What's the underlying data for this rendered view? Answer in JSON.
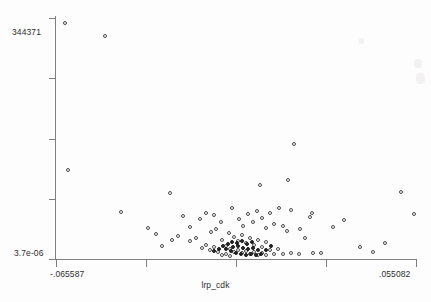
{
  "figure": {
    "background_color": "#fdfdfd",
    "axis_color": "#808080",
    "marker_color": "#4a4a4a"
  },
  "axes": {
    "y_label_top": "344371",
    "y_label_bottom": "3.7e-06",
    "x_label_left": "-.065587",
    "x_label_right": ".055082",
    "x_title": "lrp_cdk",
    "y_title": ""
  },
  "chart_data": {
    "type": "scatter",
    "title": "",
    "xlabel": "lrp_cdk",
    "ylabel": "",
    "grid": false,
    "legend": null,
    "xlim": [
      -0.065587,
      0.055082
    ],
    "ylim": [
      3.7e-06,
      344371
    ],
    "x_tick_labels": [
      "-.065587",
      "",
      "",
      "",
      ".055082"
    ],
    "y_tick_labels": [
      "344371",
      "",
      "",
      "",
      "3.7e-06"
    ],
    "n_ticks_x": 5,
    "n_ticks_y": 5,
    "marker": "open-circle",
    "points": [
      {
        "px": 65,
        "py": 23
      },
      {
        "px": 105,
        "py": 36
      },
      {
        "px": 68,
        "py": 170
      },
      {
        "px": 294,
        "py": 144
      },
      {
        "px": 170,
        "py": 193
      },
      {
        "px": 260,
        "py": 185
      },
      {
        "px": 288,
        "py": 180
      },
      {
        "px": 401,
        "py": 192
      },
      {
        "px": 121,
        "py": 212
      },
      {
        "px": 148,
        "py": 228
      },
      {
        "px": 183,
        "py": 216
      },
      {
        "px": 214,
        "py": 215
      },
      {
        "px": 196,
        "py": 238
      },
      {
        "px": 190,
        "py": 241
      },
      {
        "px": 232,
        "py": 208
      },
      {
        "px": 239,
        "py": 219
      },
      {
        "px": 243,
        "py": 226
      },
      {
        "px": 248,
        "py": 214
      },
      {
        "px": 253,
        "py": 222
      },
      {
        "px": 257,
        "py": 211
      },
      {
        "px": 262,
        "py": 218
      },
      {
        "px": 266,
        "py": 228
      },
      {
        "px": 270,
        "py": 213
      },
      {
        "px": 274,
        "py": 224
      },
      {
        "px": 229,
        "py": 233
      },
      {
        "px": 234,
        "py": 237
      },
      {
        "px": 238,
        "py": 241
      },
      {
        "px": 242,
        "py": 235
      },
      {
        "px": 246,
        "py": 243
      },
      {
        "px": 250,
        "py": 238
      },
      {
        "px": 254,
        "py": 245
      },
      {
        "px": 258,
        "py": 240
      },
      {
        "px": 262,
        "py": 247
      },
      {
        "px": 266,
        "py": 242
      },
      {
        "px": 222,
        "py": 240
      },
      {
        "px": 226,
        "py": 246
      },
      {
        "px": 230,
        "py": 249
      },
      {
        "px": 234,
        "py": 252
      },
      {
        "px": 238,
        "py": 250
      },
      {
        "px": 242,
        "py": 253
      },
      {
        "px": 246,
        "py": 251
      },
      {
        "px": 250,
        "py": 254
      },
      {
        "px": 254,
        "py": 252
      },
      {
        "px": 258,
        "py": 255
      },
      {
        "px": 262,
        "py": 253
      },
      {
        "px": 266,
        "py": 255
      },
      {
        "px": 218,
        "py": 252
      },
      {
        "px": 222,
        "py": 255
      },
      {
        "px": 226,
        "py": 254
      },
      {
        "px": 230,
        "py": 256
      },
      {
        "px": 210,
        "py": 250
      },
      {
        "px": 214,
        "py": 247
      },
      {
        "px": 206,
        "py": 245
      },
      {
        "px": 202,
        "py": 248
      },
      {
        "px": 270,
        "py": 250
      },
      {
        "px": 274,
        "py": 254
      },
      {
        "px": 278,
        "py": 249
      },
      {
        "px": 283,
        "py": 254
      },
      {
        "px": 291,
        "py": 253
      },
      {
        "px": 299,
        "py": 254
      },
      {
        "px": 313,
        "py": 253
      },
      {
        "px": 321,
        "py": 253
      },
      {
        "px": 305,
        "py": 238
      },
      {
        "px": 300,
        "py": 229
      },
      {
        "px": 287,
        "py": 231
      },
      {
        "px": 310,
        "py": 217
      },
      {
        "px": 312,
        "py": 213
      },
      {
        "px": 291,
        "py": 210
      },
      {
        "px": 279,
        "py": 208
      },
      {
        "px": 283,
        "py": 226
      },
      {
        "px": 333,
        "py": 227
      },
      {
        "px": 344,
        "py": 220
      },
      {
        "px": 360,
        "py": 247
      },
      {
        "px": 373,
        "py": 252
      },
      {
        "px": 385,
        "py": 243
      },
      {
        "px": 414,
        "py": 214
      },
      {
        "px": 172,
        "py": 240
      },
      {
        "px": 178,
        "py": 236
      },
      {
        "px": 162,
        "py": 246
      },
      {
        "px": 156,
        "py": 234
      },
      {
        "px": 200,
        "py": 219
      },
      {
        "px": 206,
        "py": 213
      },
      {
        "px": 211,
        "py": 232
      },
      {
        "px": 216,
        "py": 229
      },
      {
        "px": 221,
        "py": 222
      },
      {
        "px": 190,
        "py": 227
      }
    ],
    "dense_points": [
      {
        "px": 226,
        "py": 249
      },
      {
        "px": 231,
        "py": 251
      },
      {
        "px": 236,
        "py": 253
      },
      {
        "px": 241,
        "py": 254
      },
      {
        "px": 246,
        "py": 255
      },
      {
        "px": 251,
        "py": 254
      },
      {
        "px": 256,
        "py": 255
      },
      {
        "px": 261,
        "py": 254
      },
      {
        "px": 223,
        "py": 246
      },
      {
        "px": 228,
        "py": 244
      },
      {
        "px": 233,
        "py": 247
      },
      {
        "px": 238,
        "py": 246
      },
      {
        "px": 243,
        "py": 248
      },
      {
        "px": 248,
        "py": 249
      },
      {
        "px": 253,
        "py": 248
      },
      {
        "px": 258,
        "py": 250
      },
      {
        "px": 232,
        "py": 242
      },
      {
        "px": 237,
        "py": 243
      },
      {
        "px": 242,
        "py": 241
      },
      {
        "px": 247,
        "py": 244
      },
      {
        "px": 252,
        "py": 242
      },
      {
        "px": 266,
        "py": 250
      },
      {
        "px": 271,
        "py": 246
      },
      {
        "px": 219,
        "py": 249
      },
      {
        "px": 214,
        "py": 251
      }
    ]
  }
}
